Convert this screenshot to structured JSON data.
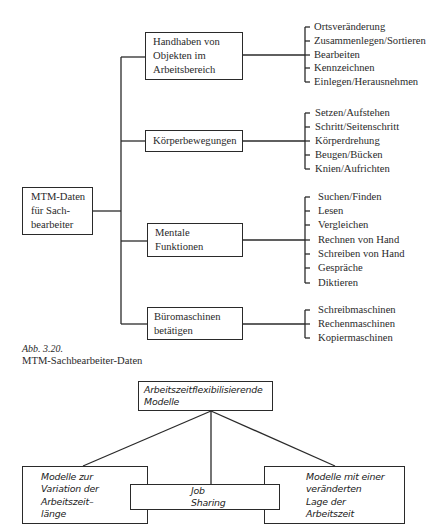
{
  "diagram1": {
    "root": {
      "label": "MTM-Daten\nfür Sach-\nbearbeiter"
    },
    "branches": [
      {
        "label": "Handhaben von\nObjekten im\nArbeitsbereich",
        "items": [
          "Ortsveränderung",
          "Zusammenlegen/Sortieren",
          "Bearbeiten",
          "Kennzeichnen",
          "Einlegen/Herausnehmen"
        ]
      },
      {
        "label": "Körperbewegungen",
        "items": [
          "Setzen/Aufstehen",
          "Schritt/Seitenschritt",
          "Körperdrehung",
          "Beugen/Bücken",
          "Knien/Aufrichten"
        ]
      },
      {
        "label": "Mentale\nFunktionen",
        "items": [
          "Suchen/Finden",
          "Lesen",
          "Vergleichen",
          "Rechnen von Hand",
          "Schreiben von Hand",
          "Gespräche",
          "Diktieren"
        ]
      },
      {
        "label": "Büromaschinen\nbetätigen",
        "items": [
          "Schreibmaschinen",
          "Rechenmaschinen",
          "Kopiermaschinen"
        ]
      }
    ],
    "caption": {
      "number": "Abb. 3.20.",
      "title": "MTM-Sachbearbeiter-Daten"
    }
  },
  "diagram2": {
    "top": {
      "label": "Arbeitszeitflexibilisierende\nModelle"
    },
    "left": {
      "label": "Modelle zur\nVariation der\nArbeitszeit–\nlänge"
    },
    "center": {
      "label": "Job\nSharing"
    },
    "right": {
      "label": "Modelle mit einer\nveränderten\nLage der\nArbeitszeit"
    }
  },
  "colors": {
    "ink": "#2a2a2a",
    "paper": "#ffffff"
  }
}
